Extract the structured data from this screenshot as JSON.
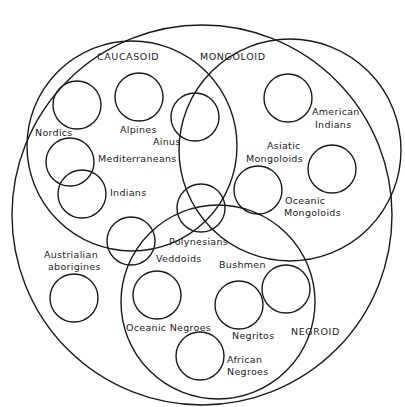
{
  "diagram": {
    "type": "venn / set-membership diagram",
    "groups": [
      {
        "id": "caucasoid",
        "label": "CAUCASOID"
      },
      {
        "id": "mongoloid",
        "label": "MONGOLOID"
      },
      {
        "id": "negroid",
        "label": "NEGROID"
      }
    ],
    "populations": [
      {
        "id": "nordics",
        "label": "Nordics",
        "group": "caucasoid"
      },
      {
        "id": "alpines",
        "label": "Alpines",
        "group": "caucasoid"
      },
      {
        "id": "mediterraneans",
        "label": "Mediterraneans",
        "group": "caucasoid"
      },
      {
        "id": "indians",
        "label": "Indians",
        "group": "caucasoid"
      },
      {
        "id": "ainus",
        "label": "Ainus",
        "group": "caucasoid/mongoloid"
      },
      {
        "id": "american_indians",
        "label1": "American",
        "label2": "Indians",
        "group": "mongoloid"
      },
      {
        "id": "asiatic_mongoloids",
        "label1": "Asiatic",
        "label2": "Mongoloids",
        "group": "mongoloid"
      },
      {
        "id": "oceanic_mongoloids",
        "label1": "Oceanic",
        "label2": "Mongoloids",
        "group": "mongoloid"
      },
      {
        "id": "polynesians",
        "label": "Polynesians",
        "group": "caucasoid/mongoloid/negroid"
      },
      {
        "id": "veddoids",
        "label": "Veddoids",
        "group": "caucasoid/negroid"
      },
      {
        "id": "australian_aborigines",
        "label1": "Austrialian",
        "label2": "aborigines",
        "group": "none"
      },
      {
        "id": "bushmen",
        "label": "Bushmen",
        "group": "negroid"
      },
      {
        "id": "oceanic_negroes",
        "label": "Oceanic Negroes",
        "group": "negroid"
      },
      {
        "id": "negritos",
        "label": "Negritos",
        "group": "negroid"
      },
      {
        "id": "african_negroes",
        "label1": "African",
        "label2": "Negroes",
        "group": "negroid"
      }
    ]
  }
}
